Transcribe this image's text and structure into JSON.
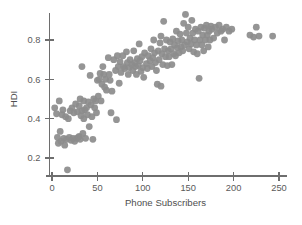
{
  "chart_data": {
    "type": "scatter",
    "title": "",
    "subtitle": "",
    "xlabel": "Phone Subscribers",
    "ylabel": "HDI",
    "xlim": [
      -8,
      258
    ],
    "ylim": [
      0.12,
      0.96
    ],
    "xticks": [
      0,
      50,
      100,
      150,
      200,
      250
    ],
    "xticklabels": [
      "0",
      "50",
      "100",
      "150",
      "200",
      "250"
    ],
    "yticks": [
      0.2,
      0.4,
      0.6,
      0.8
    ],
    "yticklabels": [
      "0.2",
      "0.4",
      "0.6",
      "0.8"
    ],
    "grid": false,
    "legend": null,
    "legend_position": "none",
    "marker": {
      "shape": "circle",
      "color": "#8c8c8c",
      "size": 3.4,
      "opacity": 0.92
    },
    "annotations": [],
    "series": [
      {
        "name": "Countries",
        "color": "#8c8c8c",
        "points": [
          [
            3,
            0.455
          ],
          [
            5,
            0.425
          ],
          [
            6,
            0.305
          ],
          [
            7,
            0.275
          ],
          [
            8,
            0.49
          ],
          [
            9,
            0.335
          ],
          [
            10,
            0.285
          ],
          [
            11,
            0.42
          ],
          [
            12,
            0.445
          ],
          [
            13,
            0.3
          ],
          [
            14,
            0.265
          ],
          [
            15,
            0.41
          ],
          [
            16,
            0.295
          ],
          [
            17,
            0.14
          ],
          [
            18,
            0.4
          ],
          [
            19,
            0.305
          ],
          [
            20,
            0.44
          ],
          [
            21,
            0.29
          ],
          [
            22,
            0.455
          ],
          [
            23,
            0.3
          ],
          [
            24,
            0.43
          ],
          [
            25,
            0.285
          ],
          [
            26,
            0.475
          ],
          [
            27,
            0.3
          ],
          [
            28,
            0.435
          ],
          [
            29,
            0.305
          ],
          [
            30,
            0.465
          ],
          [
            30,
            0.31
          ],
          [
            31,
            0.5
          ],
          [
            31,
            0.295
          ],
          [
            32,
            0.415
          ],
          [
            33,
            0.665
          ],
          [
            33,
            0.44
          ],
          [
            34,
            0.325
          ],
          [
            35,
            0.49
          ],
          [
            35,
            0.4
          ],
          [
            36,
            0.445
          ],
          [
            37,
            0.3
          ],
          [
            38,
            0.455
          ],
          [
            39,
            0.42
          ],
          [
            40,
            0.485
          ],
          [
            41,
            0.36
          ],
          [
            42,
            0.62
          ],
          [
            43,
            0.47
          ],
          [
            44,
            0.41
          ],
          [
            45,
            0.295
          ],
          [
            46,
            0.5
          ],
          [
            47,
            0.455
          ],
          [
            48,
            0.49
          ],
          [
            49,
            0.43
          ],
          [
            50,
            0.595
          ],
          [
            51,
            0.515
          ],
          [
            52,
            0.6
          ],
          [
            53,
            0.63
          ],
          [
            54,
            0.49
          ],
          [
            55,
            0.575
          ],
          [
            56,
            0.665
          ],
          [
            57,
            0.625
          ],
          [
            58,
            0.56
          ],
          [
            59,
            0.6
          ],
          [
            60,
            0.545
          ],
          [
            62,
            0.71
          ],
          [
            63,
            0.625
          ],
          [
            64,
            0.595
          ],
          [
            65,
            0.43
          ],
          [
            66,
            0.54
          ],
          [
            68,
            0.7
          ],
          [
            70,
            0.645
          ],
          [
            71,
            0.395
          ],
          [
            72,
            0.72
          ],
          [
            73,
            0.665
          ],
          [
            74,
            0.58
          ],
          [
            75,
            0.69
          ],
          [
            76,
            0.635
          ],
          [
            78,
            0.72
          ],
          [
            79,
            0.665
          ],
          [
            80,
            0.655
          ],
          [
            82,
            0.74
          ],
          [
            83,
            0.685
          ],
          [
            84,
            0.625
          ],
          [
            85,
            0.66
          ],
          [
            86,
            0.7
          ],
          [
            88,
            0.675
          ],
          [
            89,
            0.645
          ],
          [
            90,
            0.745
          ],
          [
            91,
            0.685
          ],
          [
            92,
            0.665
          ],
          [
            93,
            0.625
          ],
          [
            94,
            0.705
          ],
          [
            95,
            0.67
          ],
          [
            96,
            0.78
          ],
          [
            97,
            0.695
          ],
          [
            98,
            0.64
          ],
          [
            99,
            0.715
          ],
          [
            100,
            0.66
          ],
          [
            101,
            0.61
          ],
          [
            102,
            0.735
          ],
          [
            104,
            0.68
          ],
          [
            105,
            0.655
          ],
          [
            106,
            0.72
          ],
          [
            108,
            0.695
          ],
          [
            109,
            0.755
          ],
          [
            110,
            0.665
          ],
          [
            111,
            0.71
          ],
          [
            112,
            0.8
          ],
          [
            113,
            0.735
          ],
          [
            114,
            0.685
          ],
          [
            115,
            0.645
          ],
          [
            116,
            0.575
          ],
          [
            117,
            0.745
          ],
          [
            118,
            0.7
          ],
          [
            119,
            0.785
          ],
          [
            120,
            0.565
          ],
          [
            120,
            0.82
          ],
          [
            121,
            0.73
          ],
          [
            122,
            0.675
          ],
          [
            123,
            0.895
          ],
          [
            124,
            0.755
          ],
          [
            125,
            0.715
          ],
          [
            126,
            0.8
          ],
          [
            127,
            0.67
          ],
          [
            128,
            0.745
          ],
          [
            129,
            0.715
          ],
          [
            130,
            0.79
          ],
          [
            131,
            0.755
          ],
          [
            132,
            0.675
          ],
          [
            133,
            0.805
          ],
          [
            134,
            0.73
          ],
          [
            135,
            0.775
          ],
          [
            136,
            0.72
          ],
          [
            137,
            0.845
          ],
          [
            138,
            0.76
          ],
          [
            139,
            0.795
          ],
          [
            140,
            0.735
          ],
          [
            141,
            0.83
          ],
          [
            142,
            0.765
          ],
          [
            143,
            0.8
          ],
          [
            144,
            0.745
          ],
          [
            145,
            0.885
          ],
          [
            146,
            0.775
          ],
          [
            147,
            0.93
          ],
          [
            148,
            0.835
          ],
          [
            149,
            0.79
          ],
          [
            150,
            0.865
          ],
          [
            151,
            0.755
          ],
          [
            152,
            0.81
          ],
          [
            153,
            0.78
          ],
          [
            154,
            0.9
          ],
          [
            155,
            0.835
          ],
          [
            156,
            0.74
          ],
          [
            157,
            0.8
          ],
          [
            158,
            0.855
          ],
          [
            159,
            0.775
          ],
          [
            160,
            0.73
          ],
          [
            161,
            0.845
          ],
          [
            162,
            0.605
          ],
          [
            163,
            0.8
          ],
          [
            164,
            0.865
          ],
          [
            165,
            0.775
          ],
          [
            166,
            0.825
          ],
          [
            167,
            0.745
          ],
          [
            168,
            0.86
          ],
          [
            169,
            0.8
          ],
          [
            170,
            0.875
          ],
          [
            171,
            0.825
          ],
          [
            172,
            0.765
          ],
          [
            173,
            0.845
          ],
          [
            174,
            0.8
          ],
          [
            175,
            0.87
          ],
          [
            176,
            0.855
          ],
          [
            178,
            0.81
          ],
          [
            180,
            0.865
          ],
          [
            182,
            0.835
          ],
          [
            184,
            0.875
          ],
          [
            186,
            0.845
          ],
          [
            188,
            0.855
          ],
          [
            190,
            0.8
          ],
          [
            192,
            0.865
          ],
          [
            195,
            0.845
          ],
          [
            198,
            0.855
          ],
          [
            218,
            0.825
          ],
          [
            222,
            0.815
          ],
          [
            225,
            0.865
          ],
          [
            228,
            0.82
          ],
          [
            243,
            0.82
          ]
        ]
      }
    ]
  },
  "axes": {
    "x_title": "Phone Subscribers",
    "y_title": "HDI"
  }
}
